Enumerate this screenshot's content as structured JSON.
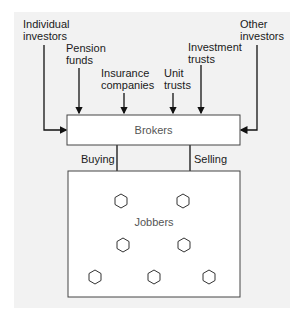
{
  "diagram": {
    "sources": [
      {
        "id": "individual",
        "lines": [
          "Individual",
          "investors"
        ]
      },
      {
        "id": "pension",
        "lines": [
          "Pension",
          "funds"
        ]
      },
      {
        "id": "insurance",
        "lines": [
          "Insurance",
          "companies"
        ]
      },
      {
        "id": "unit",
        "lines": [
          "Unit",
          "trusts"
        ]
      },
      {
        "id": "investment",
        "lines": [
          "Investment",
          "trusts"
        ]
      },
      {
        "id": "other",
        "lines": [
          "Other",
          "investors"
        ]
      }
    ],
    "brokers": {
      "label": "Brokers"
    },
    "flows": {
      "buying": "Buying",
      "selling": "Selling"
    },
    "jobbers": {
      "label": "Jobbers",
      "hexagon_count": 7
    }
  }
}
